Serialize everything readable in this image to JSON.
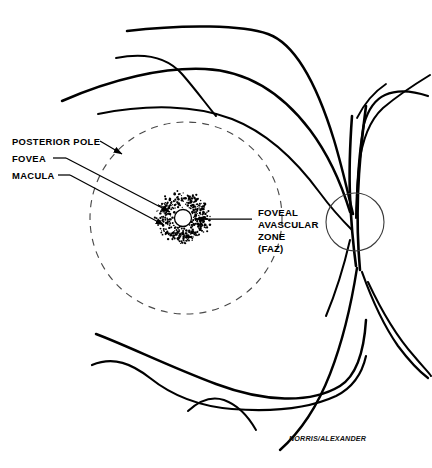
{
  "figure": {
    "signature": "NORRIS/ALEXANDER",
    "background_color": "#ffffff",
    "ink_color": "#000000"
  },
  "labels": {
    "posterior_pole": "POSTERIOR POLE",
    "fovea": "FOVEA",
    "macula": "MACULA",
    "faz_line1": "FOVEAL",
    "faz_line2": "AVASCULAR",
    "faz_line3": "ZONE",
    "faz_line4": "(FAZ)"
  },
  "structures": {
    "posterior_pole_boundary": {
      "name": "posterior-pole-dashed-circle",
      "center_x": 186,
      "center_y": 218,
      "radius": 96,
      "style": "dashed",
      "color": "#4a4a4a"
    },
    "macula_stipple": {
      "name": "macula-stippled-ring",
      "center_x": 183,
      "center_y": 218,
      "outer_radius": 29,
      "inner_radius": 9,
      "dot_count": 430,
      "color": "#000000"
    },
    "foveal_avascular_zone": {
      "name": "faz-clear-circle",
      "center_x": 183,
      "center_y": 218,
      "radius": 8.5,
      "fill": "#ffffff",
      "stroke": "#000000"
    },
    "optic_disc": {
      "name": "optic-disc-circle",
      "center_x": 355,
      "center_y": 222,
      "radius": 29,
      "stroke": "#3a3a3a"
    }
  },
  "vessels": {
    "description": "Retinal vessel arcades radiating from the optic disc",
    "paths": [
      {
        "name": "superior-arcade-outer",
        "d": "M127,31 C185,24 243,25 268,34 C296,44 318,88 334,140 C343,170 349,198 353,214",
        "width": 2.5
      },
      {
        "name": "superior-arcade-branch-upper",
        "d": "M116,58 C146,52 168,58 182,74 C196,90 206,104 216,116",
        "width": 2.0
      },
      {
        "name": "superior-arcade-main",
        "d": "M62,101 C112,79 164,67 205,69 C248,71 282,93 310,130 C328,154 342,186 350,212",
        "width": 2.5
      },
      {
        "name": "superior-arcade-lower",
        "d": "M98,114 C148,104 196,105 232,119 C268,133 298,163 320,193 C334,212 344,222 352,230",
        "width": 2.0
      },
      {
        "name": "temporal-upper-branch",
        "d": "M428,96 C410,90 396,90 385,95 C374,100 368,110 364,124 C361,140 358,170 357,196",
        "width": 2.2
      },
      {
        "name": "temporal-upper-cross",
        "d": "M430,75 C412,86 396,97 383,108 C370,120 362,140 359,166 C357,188 356,206 356,218",
        "width": 2.0
      },
      {
        "name": "disc-trunk-left",
        "d": "M352,116 C350,144 349,172 350,196 C351,220 353,244 356,266",
        "width": 2.6
      },
      {
        "name": "disc-trunk-right",
        "d": "M366,106 C362,136 359,166 358,194 C357,222 358,248 360,270",
        "width": 2.6
      },
      {
        "name": "inferior-arcade-main",
        "d": "M96,334 C128,346 168,366 216,384 C264,402 310,404 340,386 C356,376 364,352 366,320",
        "width": 2.5
      },
      {
        "name": "inferior-arcade-lower",
        "d": "M92,365 C114,356 132,364 150,378 C170,394 196,406 232,409 C272,412 310,408 336,396 C352,388 362,374 366,356",
        "width": 2.2
      },
      {
        "name": "inferior-nasal-branch",
        "d": "M188,411 C200,400 212,396 224,400 C238,405 248,416 256,430",
        "width": 2.0
      },
      {
        "name": "inferior-temporal-descending",
        "d": "M357,268 C352,300 344,338 330,374 C316,410 298,434 280,450",
        "width": 2.4
      },
      {
        "name": "inferior-temporal-lateral",
        "d": "M362,272 C372,300 384,326 398,346 C410,362 420,372 428,378",
        "width": 2.2
      },
      {
        "name": "inferior-temporal-far",
        "d": "M368,282 C382,312 398,338 414,356 C424,368 430,374 431,376",
        "width": 2.0
      },
      {
        "name": "superior-temporal-spur",
        "d": "M357,118 C364,104 374,92 386,84",
        "width": 1.8
      },
      {
        "name": "disc-exit-lower-left",
        "d": "M350,240 C344,266 336,292 326,316",
        "width": 2.0
      }
    ]
  },
  "leaders": [
    {
      "name": "posterior-pole-leader",
      "from_x": 100,
      "from_y": 141,
      "to_x": 124,
      "to_y": 155,
      "arrow": true
    },
    {
      "name": "fovea-leader",
      "from_x": 66,
      "from_y": 158,
      "to_x": 172,
      "to_y": 213,
      "arrow": true
    },
    {
      "name": "macula-leader",
      "from_x": 70,
      "from_y": 175,
      "to_x": 166,
      "to_y": 226,
      "arrow": true
    },
    {
      "name": "faz-leader",
      "from_x": 252,
      "from_y": 220,
      "to_x": 194,
      "to_y": 220,
      "arrow": true
    }
  ],
  "label_positions": {
    "posterior_pole": {
      "x": 12,
      "y": 145
    },
    "fovea": {
      "x": 12,
      "y": 162
    },
    "macula": {
      "x": 12,
      "y": 179
    },
    "faz_block": {
      "x": 258,
      "y": 213
    },
    "signature": {
      "x": 289,
      "y": 441
    }
  }
}
